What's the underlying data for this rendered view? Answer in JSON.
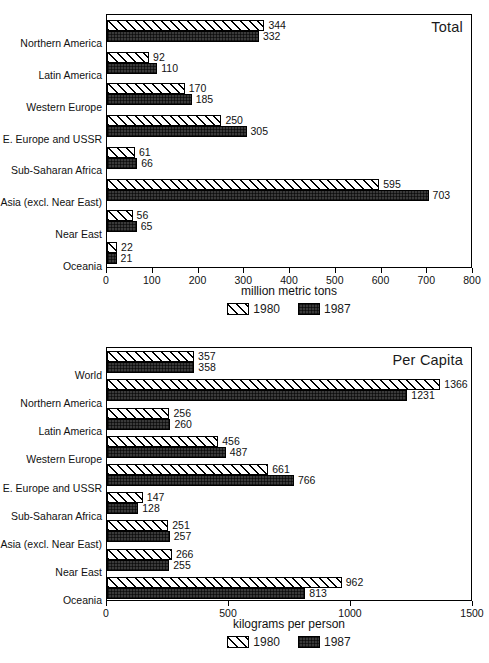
{
  "chart_data": [
    {
      "id": "total",
      "type": "bar",
      "orientation": "horizontal",
      "title": "Total",
      "xlabel": "million metric tons",
      "ylabel": "",
      "xlim": [
        0,
        800
      ],
      "xticks": [
        0,
        100,
        200,
        300,
        400,
        500,
        600,
        700,
        800
      ],
      "xtick_labels": [
        "0",
        "100",
        "200",
        "300",
        "400",
        "500",
        "600",
        "700",
        "800"
      ],
      "grid": false,
      "legend_position": "below",
      "categories": [
        "Northern America",
        "Latin America",
        "Western Europe",
        "E. Europe and USSR",
        "Sub-Saharan Africa",
        "Asia (excl. Near East)",
        "Near East",
        "Oceania"
      ],
      "series": [
        {
          "name": "1980",
          "pattern": "diagonal-hatch",
          "values": [
            344,
            92,
            170,
            250,
            61,
            595,
            56,
            22
          ]
        },
        {
          "name": "1987",
          "pattern": "solid-dark",
          "values": [
            332,
            110,
            185,
            305,
            66,
            703,
            65,
            21
          ]
        }
      ]
    },
    {
      "id": "per-capita",
      "type": "bar",
      "orientation": "horizontal",
      "title": "Per Capita",
      "xlabel": "kilograms per person",
      "ylabel": "",
      "xlim": [
        0,
        1500
      ],
      "xticks": [
        0,
        500,
        1000,
        1500
      ],
      "xtick_labels": [
        "0",
        "500",
        "1000",
        "1500"
      ],
      "grid": false,
      "legend_position": "below",
      "categories": [
        "World",
        "Northern America",
        "Latin America",
        "Western Europe",
        "E. Europe and USSR",
        "Sub-Saharan Africa",
        "Asia (excl. Near East)",
        "Near East",
        "Oceania"
      ],
      "series": [
        {
          "name": "1980",
          "pattern": "diagonal-hatch",
          "values": [
            357,
            1366,
            256,
            456,
            661,
            147,
            251,
            266,
            962
          ]
        },
        {
          "name": "1987",
          "pattern": "solid-dark",
          "values": [
            358,
            1231,
            260,
            487,
            766,
            128,
            257,
            255,
            813
          ]
        }
      ]
    }
  ],
  "colors": {
    "ink": "#000000",
    "text": "#111111",
    "bar_1980_fill": "#ffffff",
    "bar_1980_hatch": "#000000",
    "bar_1987_fill": "#3a3a3a",
    "background": "#ffffff"
  }
}
